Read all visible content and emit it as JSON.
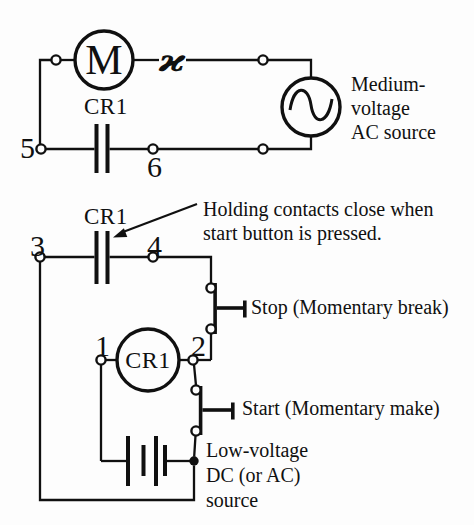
{
  "figure": {
    "background_color": "#fdfdfd",
    "ink_color": "#101010"
  },
  "power_circuit": {
    "motor_label": "M",
    "overload_symbol": "ϰ",
    "relay_contact_label": "CR1",
    "terminal_5": "5",
    "terminal_6": "6",
    "source_caption_lines": [
      "Medium-",
      "voltage",
      "AC source"
    ]
  },
  "control_circuit": {
    "relay_contact_label": "CR1",
    "terminal_3": "3",
    "terminal_4": "4",
    "terminal_1": "1",
    "terminal_2": "2",
    "relay_coil_label": "CR1",
    "annotation_lines": [
      "Holding contacts close when",
      "start button is pressed."
    ],
    "stop_button_label": "Stop (Momentary break)",
    "start_button_label": "Start (Momentary make)",
    "source_caption_lines": [
      "Low-voltage",
      "DC (or AC)",
      "source"
    ]
  }
}
